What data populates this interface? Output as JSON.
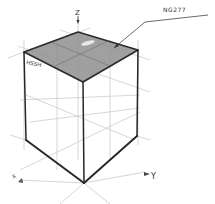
{
  "labels": {
    "z_axis": "Z",
    "y_axis": "Y",
    "x_axis": "X",
    "callout": "NG277",
    "face_label": "HSSH"
  },
  "colors": {
    "top_face": "#8a8a8a",
    "edge": "#2a2a2a",
    "construction": "#b8b8b8",
    "background": "#ffffff"
  },
  "cube": {
    "top_back": [
      78,
      32
    ],
    "top_left": [
      24,
      52
    ],
    "top_right": [
      138,
      50
    ],
    "top_front": [
      83,
      82
    ],
    "bottom_left": [
      26,
      140
    ],
    "bottom_right": [
      137,
      136
    ],
    "bottom_front": [
      84,
      183
    ]
  }
}
